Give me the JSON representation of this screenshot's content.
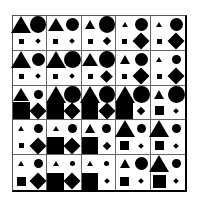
{
  "figure": {
    "type": "shape-size-matrix",
    "rows": 5,
    "cols": 5,
    "legend": {
      "tl": "triangle",
      "tr": "circle",
      "bl": "square",
      "br": "diamond"
    },
    "size_px": {
      "t": 5,
      "s": 9,
      "m": 13,
      "l": 17
    },
    "cells": [
      [
        {
          "triangle": "l",
          "circle": "l",
          "square": "t",
          "diamond": "t"
        },
        {
          "triangle": "m",
          "circle": "m",
          "square": "t",
          "diamond": "t"
        },
        {
          "triangle": "s",
          "circle": "l",
          "square": "t",
          "diamond": "s"
        },
        {
          "triangle": "t",
          "circle": "m",
          "square": "t",
          "diamond": "l"
        },
        {
          "triangle": "t",
          "circle": "m",
          "square": "t",
          "diamond": "l"
        }
      ],
      [
        {
          "triangle": "l",
          "circle": "m",
          "square": "t",
          "diamond": "t"
        },
        {
          "triangle": "l",
          "circle": "l",
          "square": "t",
          "diamond": "t"
        },
        {
          "triangle": "m",
          "circle": "l",
          "square": "t",
          "diamond": "m"
        },
        {
          "triangle": "s",
          "circle": "m",
          "square": "t",
          "diamond": "l"
        },
        {
          "triangle": "t",
          "circle": "s",
          "square": "t",
          "diamond": "l"
        }
      ],
      [
        {
          "triangle": "m",
          "circle": "s",
          "square": "l",
          "diamond": "l"
        },
        {
          "triangle": "l",
          "circle": "l",
          "square": "l",
          "diamond": "l"
        },
        {
          "triangle": "l",
          "circle": "l",
          "square": "l",
          "diamond": "l"
        },
        {
          "triangle": "l",
          "circle": "l",
          "square": "l",
          "diamond": "s"
        },
        {
          "triangle": "s",
          "circle": "l",
          "square": "s",
          "diamond": "t"
        }
      ],
      [
        {
          "triangle": "t",
          "circle": "s",
          "square": "t",
          "diamond": "l"
        },
        {
          "triangle": "t",
          "circle": "s",
          "square": "l",
          "diamond": "l"
        },
        {
          "triangle": "s",
          "circle": "s",
          "square": "l",
          "diamond": "s"
        },
        {
          "triangle": "l",
          "circle": "s",
          "square": "s",
          "diamond": "t"
        },
        {
          "triangle": "l",
          "circle": "s",
          "square": "s",
          "diamond": "t"
        }
      ],
      [
        {
          "triangle": "t",
          "circle": "s",
          "square": "s",
          "diamond": "l"
        },
        {
          "triangle": "t",
          "circle": "t",
          "square": "l",
          "diamond": "l"
        },
        {
          "triangle": "t",
          "circle": "t",
          "square": "l",
          "diamond": "t"
        },
        {
          "triangle": "s",
          "circle": "m",
          "square": "s",
          "diamond": "t"
        },
        {
          "triangle": "l",
          "circle": "s",
          "square": "m",
          "diamond": "t"
        }
      ]
    ],
    "colors": {
      "fill": "#000000",
      "background": "#ffffff",
      "grid": "#666666"
    }
  }
}
